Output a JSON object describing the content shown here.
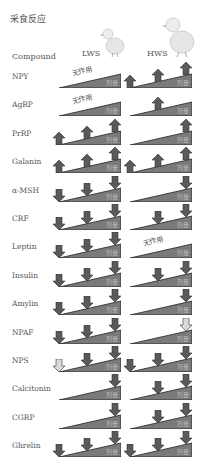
{
  "title": "采食反应",
  "headers": {
    "compound": "Compound",
    "lws": "LWS",
    "hws": "HWS"
  },
  "dose_label": "剂量",
  "no_effect_label": "无作用",
  "colors": {
    "arrow_dark": "#5a5a5a",
    "arrow_light": "#d9d9d9",
    "wedge": "#7a7a7a"
  },
  "legend_note": "arrows at low / mid / high dose; up = increase feeding, down = decrease feeding, light = weak effect",
  "rows": [
    {
      "compound": "NPY",
      "lws": {
        "no_effect": true,
        "arrows": []
      },
      "hws": {
        "no_effect": false,
        "arrows": [
          [
            "low",
            "up",
            "dark"
          ],
          [
            "mid",
            "up",
            "dark"
          ],
          [
            "high",
            "up",
            "dark"
          ]
        ]
      }
    },
    {
      "compound": "AgRP",
      "lws": {
        "no_effect": true,
        "arrows": []
      },
      "hws": {
        "no_effect": false,
        "arrows": [
          [
            "mid",
            "up",
            "dark"
          ]
        ]
      }
    },
    {
      "compound": "PrRP",
      "lws": {
        "no_effect": false,
        "arrows": [
          [
            "low",
            "up",
            "dark"
          ],
          [
            "mid",
            "up",
            "dark"
          ],
          [
            "high",
            "up",
            "dark"
          ]
        ]
      },
      "hws": {
        "no_effect": false,
        "arrows": [
          [
            "high",
            "up",
            "dark"
          ]
        ]
      }
    },
    {
      "compound": "Galanin",
      "lws": {
        "no_effect": false,
        "arrows": [
          [
            "low",
            "up",
            "dark"
          ],
          [
            "mid",
            "up",
            "dark"
          ],
          [
            "high",
            "up",
            "dark"
          ]
        ]
      },
      "hws": {
        "no_effect": false,
        "arrows": [
          [
            "low",
            "up",
            "dark"
          ],
          [
            "mid",
            "up",
            "dark"
          ],
          [
            "high",
            "up",
            "dark"
          ]
        ]
      }
    },
    {
      "compound": "α-MSH",
      "lws": {
        "no_effect": false,
        "arrows": [
          [
            "low",
            "down",
            "dark"
          ],
          [
            "mid",
            "down",
            "dark"
          ],
          [
            "high",
            "down",
            "dark"
          ]
        ]
      },
      "hws": {
        "no_effect": false,
        "arrows": [
          [
            "high",
            "down",
            "dark"
          ]
        ]
      }
    },
    {
      "compound": "CRF",
      "lws": {
        "no_effect": false,
        "arrows": [
          [
            "low",
            "down",
            "dark"
          ],
          [
            "mid",
            "down",
            "dark"
          ],
          [
            "high",
            "down",
            "dark"
          ]
        ]
      },
      "hws": {
        "no_effect": false,
        "arrows": [
          [
            "mid",
            "down",
            "dark"
          ],
          [
            "high",
            "down",
            "dark"
          ]
        ]
      }
    },
    {
      "compound": "Leptin",
      "lws": {
        "no_effect": false,
        "arrows": [
          [
            "low",
            "down",
            "dark"
          ],
          [
            "mid",
            "down",
            "dark"
          ],
          [
            "high",
            "down",
            "dark"
          ]
        ]
      },
      "hws": {
        "no_effect": true,
        "arrows": []
      }
    },
    {
      "compound": "Insulin",
      "lws": {
        "no_effect": false,
        "arrows": [
          [
            "low",
            "down",
            "dark"
          ],
          [
            "mid",
            "down",
            "dark"
          ],
          [
            "high",
            "down",
            "dark"
          ]
        ]
      },
      "hws": {
        "no_effect": false,
        "arrows": [
          [
            "mid",
            "down",
            "dark"
          ],
          [
            "high",
            "down",
            "dark"
          ]
        ]
      }
    },
    {
      "compound": "Amylin",
      "lws": {
        "no_effect": false,
        "arrows": [
          [
            "low",
            "down",
            "dark"
          ],
          [
            "mid",
            "down",
            "dark"
          ],
          [
            "high",
            "down",
            "dark"
          ]
        ]
      },
      "hws": {
        "no_effect": false,
        "arrows": [
          [
            "high",
            "down",
            "dark"
          ]
        ]
      }
    },
    {
      "compound": "NPAF",
      "lws": {
        "no_effect": false,
        "arrows": [
          [
            "low",
            "down",
            "dark"
          ],
          [
            "mid",
            "down",
            "dark"
          ],
          [
            "high",
            "down",
            "dark"
          ]
        ]
      },
      "hws": {
        "no_effect": false,
        "arrows": [
          [
            "high",
            "down",
            "light"
          ]
        ]
      }
    },
    {
      "compound": "NPS",
      "lws": {
        "no_effect": false,
        "arrows": [
          [
            "low",
            "down",
            "light"
          ],
          [
            "mid",
            "down",
            "dark"
          ],
          [
            "high",
            "down",
            "dark"
          ]
        ]
      },
      "hws": {
        "no_effect": false,
        "arrows": [
          [
            "low",
            "down",
            "dark"
          ],
          [
            "mid",
            "down",
            "dark"
          ],
          [
            "high",
            "down",
            "dark"
          ]
        ]
      }
    },
    {
      "compound": "Calcitonin",
      "lws": {
        "no_effect": false,
        "arrows": [
          [
            "high",
            "down",
            "dark"
          ]
        ]
      },
      "hws": {
        "no_effect": false,
        "arrows": [
          [
            "mid",
            "down",
            "dark"
          ],
          [
            "high",
            "down",
            "dark"
          ]
        ]
      }
    },
    {
      "compound": "CGRP",
      "lws": {
        "no_effect": false,
        "arrows": [
          [
            "high",
            "down",
            "dark"
          ]
        ]
      },
      "hws": {
        "no_effect": false,
        "arrows": [
          [
            "mid",
            "down",
            "dark"
          ],
          [
            "high",
            "down",
            "dark"
          ]
        ]
      }
    },
    {
      "compound": "Ghrelin",
      "lws": {
        "no_effect": false,
        "arrows": [
          [
            "low",
            "down",
            "dark"
          ],
          [
            "mid",
            "down",
            "dark"
          ],
          [
            "high",
            "down",
            "dark"
          ]
        ]
      },
      "hws": {
        "no_effect": false,
        "arrows": [
          [
            "low",
            "down",
            "dark"
          ],
          [
            "mid",
            "down",
            "dark"
          ],
          [
            "high",
            "down",
            "dark"
          ]
        ]
      }
    }
  ]
}
